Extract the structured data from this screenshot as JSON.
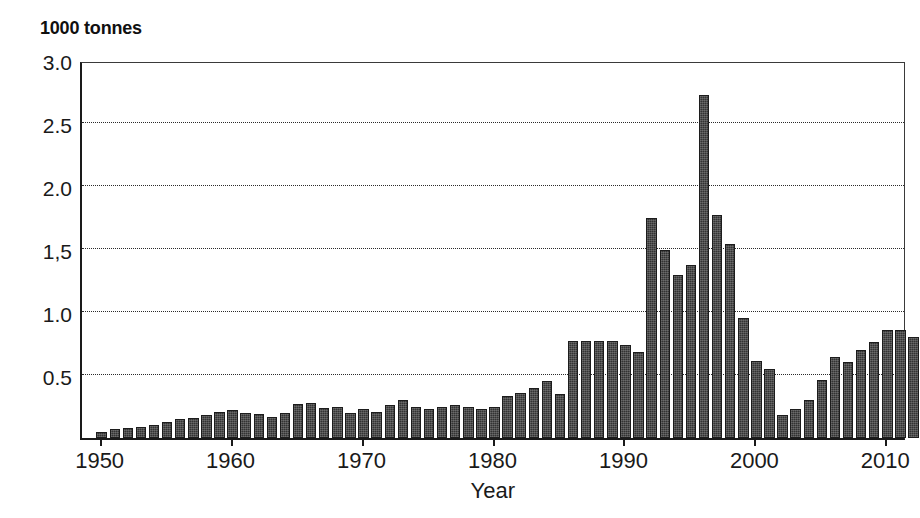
{
  "figure": {
    "y_unit_title": "1000 tonnes",
    "x_axis_title": "Year",
    "background_color": "#ffffff",
    "bar_color": "#333333",
    "axis_color": "#1a1a1a"
  },
  "axes": {
    "y_tick_labels": [
      "3.0",
      "2.5",
      "2.0",
      "1,5",
      "1.0",
      "0.5"
    ],
    "y_tick_values": [
      3.0,
      2.5,
      2.0,
      1.5,
      1.0,
      0.5
    ],
    "x_tick_labels": [
      "1950",
      "1960",
      "1970",
      "1980",
      "1990",
      "2000",
      "2010"
    ],
    "x_tick_values": [
      1950,
      1960,
      1970,
      1980,
      1990,
      2000,
      2010
    ]
  },
  "chart_data": {
    "type": "bar",
    "title": "",
    "subtitle": "",
    "xlabel": "Year",
    "ylabel": "1000 tonnes",
    "ylim": [
      0,
      3.0
    ],
    "xlim": [
      1949,
      2012
    ],
    "grid": true,
    "legend": null,
    "yticks": [
      0.5,
      1.0,
      1.5,
      2.0,
      2.5,
      3.0
    ],
    "ytick_labels": [
      "0.5",
      "1.0",
      "1,5",
      "2.0",
      "2.5",
      "3.0"
    ],
    "xticks": [
      1950,
      1960,
      1970,
      1980,
      1990,
      2000,
      2010
    ],
    "categories": [
      1950,
      1951,
      1952,
      1953,
      1954,
      1955,
      1956,
      1957,
      1958,
      1959,
      1960,
      1961,
      1962,
      1963,
      1964,
      1965,
      1966,
      1967,
      1968,
      1969,
      1970,
      1971,
      1972,
      1973,
      1974,
      1975,
      1976,
      1977,
      1978,
      1979,
      1980,
      1981,
      1982,
      1983,
      1984,
      1985,
      1986,
      1987,
      1988,
      1989,
      1990,
      1991,
      1992,
      1993,
      1994,
      1995,
      1996,
      1997,
      1998,
      1999,
      2000,
      2001,
      2002,
      2003,
      2004,
      2005,
      2006,
      2007,
      2008,
      2009,
      2010,
      2011,
      2012
    ],
    "values": [
      0.05,
      0.07,
      0.08,
      0.09,
      0.1,
      0.13,
      0.15,
      0.16,
      0.18,
      0.21,
      0.22,
      0.2,
      0.19,
      0.17,
      0.2,
      0.27,
      0.28,
      0.24,
      0.25,
      0.2,
      0.23,
      0.21,
      0.26,
      0.3,
      0.25,
      0.23,
      0.25,
      0.26,
      0.25,
      0.23,
      0.25,
      0.33,
      0.36,
      0.4,
      0.45,
      0.35,
      0.77,
      0.77,
      0.77,
      0.77,
      0.74,
      0.68,
      1.75,
      1.49,
      1.29,
      1.37,
      2.72,
      1.77,
      1.54,
      0.95,
      0.61,
      0.55,
      0.18,
      0.23,
      0.3,
      0.46,
      0.64,
      0.6,
      0.7,
      0.76,
      0.86,
      0.86,
      0.8
    ]
  }
}
